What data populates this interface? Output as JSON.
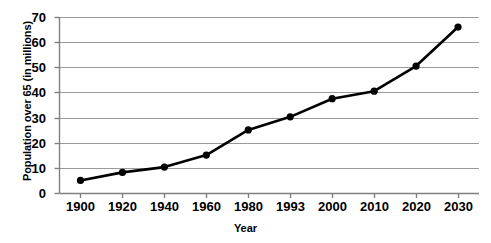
{
  "chart_data": {
    "type": "line",
    "title": "",
    "xlabel": "Year",
    "ylabel": "Population over 65 (in millions)",
    "categories": [
      "1900",
      "1920",
      "1940",
      "1960",
      "1980",
      "1993",
      "2000",
      "2010",
      "2020",
      "2030"
    ],
    "values": [
      5,
      8.2,
      10.3,
      15.1,
      25.1,
      30.3,
      37.5,
      40.5,
      50.5,
      66
    ],
    "series": [
      {
        "name": "Population over 65",
        "values": [
          5,
          8.2,
          10.3,
          15.1,
          25.1,
          30.3,
          37.5,
          40.5,
          50.5,
          66
        ]
      }
    ],
    "ylim": [
      0,
      70
    ],
    "yticks": [
      "0",
      "10",
      "20",
      "30",
      "40",
      "50",
      "60",
      "70"
    ],
    "ytick_values": [
      0,
      10,
      20,
      30,
      40,
      50,
      60,
      70
    ],
    "grid": "horizontal",
    "legend": "none",
    "line_color": "#000000",
    "marker": "filled-circle",
    "marker_color": "#000000",
    "gridline_color": "#9a9a9a",
    "axis_color": "#808080",
    "background_color": "#ffffff"
  },
  "axes": {
    "y_title": "Population over 65 (in millions)",
    "x_title": "Year"
  }
}
